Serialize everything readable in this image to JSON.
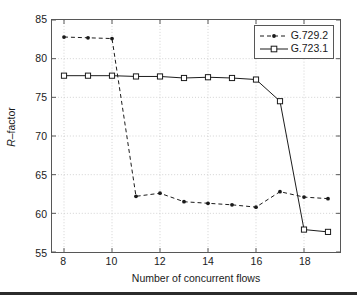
{
  "figure": {
    "background_color": "#ffffff",
    "axis_color": "#575757",
    "grid_color": "#c8c8c8",
    "series_color": "#1a1a1a"
  },
  "legend": {
    "position": "top-right",
    "entries": [
      {
        "label": "G.729.2",
        "style": "dashed",
        "marker": "dot"
      },
      {
        "label": "G.723.1",
        "style": "solid",
        "marker": "square"
      }
    ]
  },
  "chart_data": {
    "type": "line",
    "title": "",
    "xlabel": "Number of concurrent flows",
    "ylabel": "R-factor",
    "xlim": [
      7.5,
      19.5
    ],
    "ylim": [
      55,
      85
    ],
    "xticks": [
      8,
      10,
      12,
      14,
      16,
      18
    ],
    "xtick_labels": [
      "8",
      "10",
      "12",
      "14",
      "16",
      "18"
    ],
    "yticks": [
      55,
      60,
      65,
      70,
      75,
      80,
      85
    ],
    "ytick_labels": [
      "55",
      "60",
      "65",
      "70",
      "75",
      "80",
      "85"
    ],
    "grid": true,
    "x": [
      8,
      9,
      10,
      11,
      12,
      13,
      14,
      15,
      16,
      17,
      18,
      19
    ],
    "series": [
      {
        "name": "G.729.2",
        "style": "dashed",
        "marker": "dot",
        "values": [
          82.8,
          82.7,
          82.6,
          62.2,
          62.6,
          61.5,
          61.3,
          61.1,
          60.8,
          62.8,
          62.1,
          61.9
        ]
      },
      {
        "name": "G.723.1",
        "style": "solid",
        "marker": "square",
        "values": [
          77.8,
          77.8,
          77.8,
          77.7,
          77.7,
          77.5,
          77.6,
          77.5,
          77.3,
          74.5,
          57.9,
          57.6
        ]
      }
    ]
  }
}
